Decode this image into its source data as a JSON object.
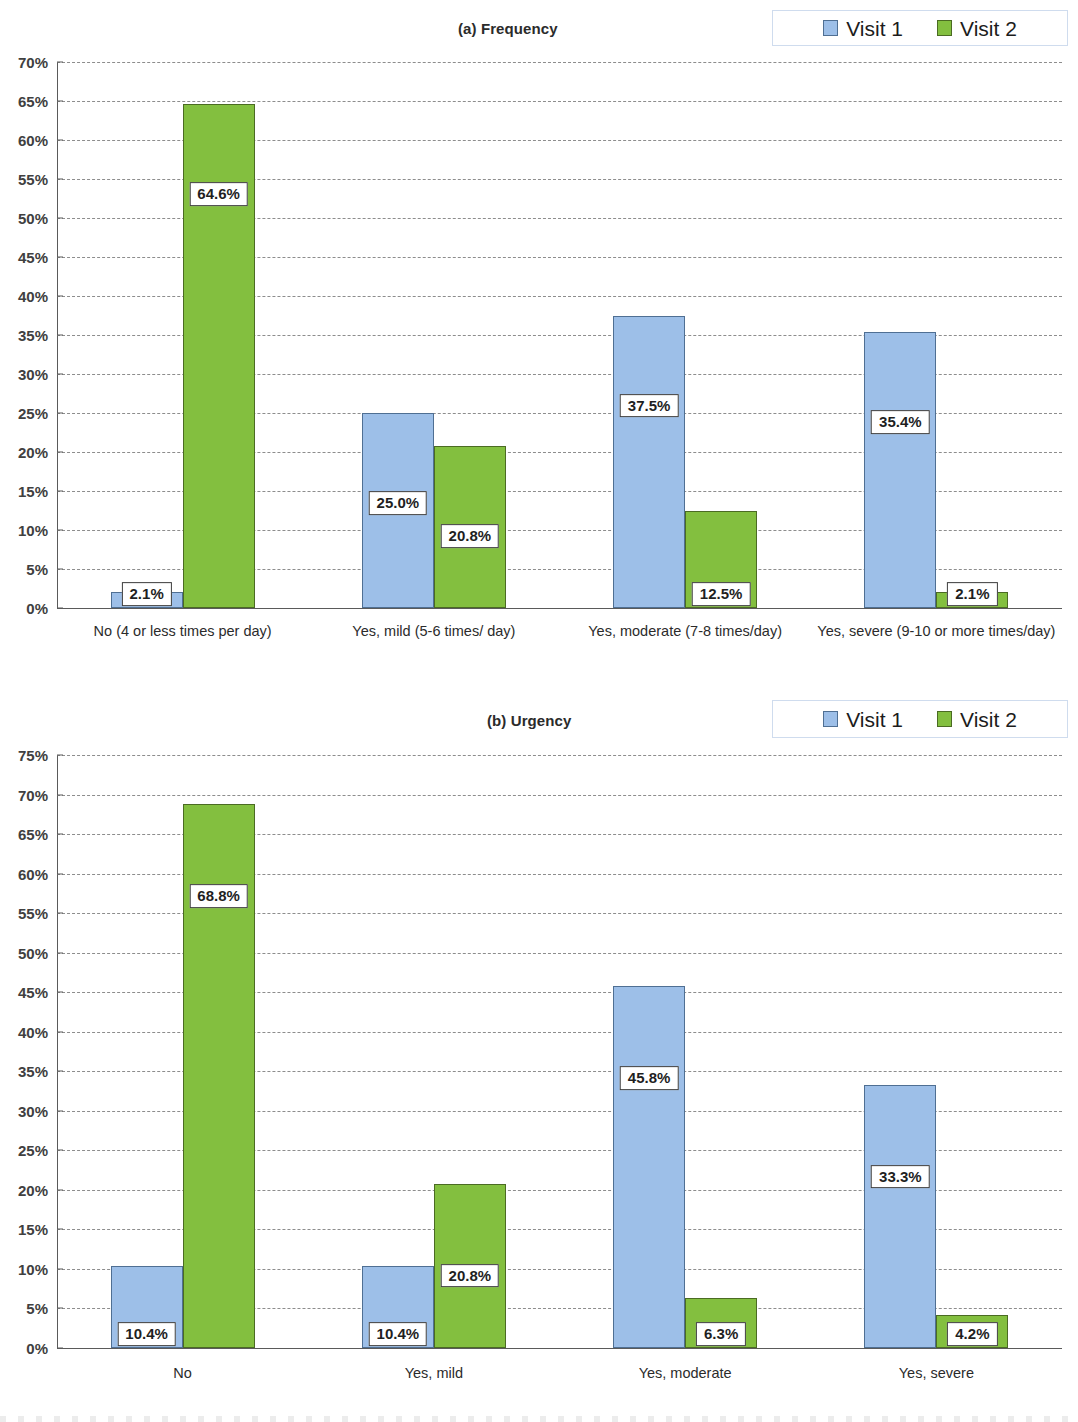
{
  "colors": {
    "visit1": "#9dbfe8",
    "visit1_border": "#4f6f93",
    "visit2": "#83bf3f",
    "visit2_border": "#4b6b23",
    "gridline": "#7a7a7a",
    "axis": "#5a5a5a",
    "text": "#2b2b2b"
  },
  "legend": {
    "visit1_label": "Visit 1",
    "visit2_label": "Visit 2"
  },
  "chart_data": [
    {
      "id": "frequency",
      "type": "bar",
      "title": "(a) Frequency",
      "xlabel": "",
      "ylabel": "",
      "ylim": [
        0,
        70
      ],
      "ytick_step": 5,
      "grid": true,
      "legend_position": "top-right",
      "categories": [
        "No (4 or less times per day)",
        "Yes, mild (5-6 times/ day)",
        "Yes, moderate (7-8 times/day)",
        "Yes, severe (9-10 or more times/day)"
      ],
      "ytick_labels": [
        "0%",
        "5%",
        "10%",
        "15%",
        "20%",
        "25%",
        "30%",
        "35%",
        "40%",
        "45%",
        "50%",
        "55%",
        "60%",
        "65%",
        "70%"
      ],
      "series": [
        {
          "name": "Visit 1",
          "values": [
            2.1,
            25.0,
            37.5,
            35.4
          ],
          "labels": [
            "2.1%",
            "25.0%",
            "37.5%",
            "35.4%"
          ]
        },
        {
          "name": "Visit 2",
          "values": [
            64.6,
            20.8,
            12.5,
            2.1
          ],
          "labels": [
            "64.6%",
            "20.8%",
            "12.5%",
            "2.1%"
          ]
        }
      ]
    },
    {
      "id": "urgency",
      "type": "bar",
      "title": "(b) Urgency",
      "xlabel": "",
      "ylabel": "",
      "ylim": [
        0,
        75
      ],
      "ytick_step": 5,
      "grid": true,
      "legend_position": "top-right",
      "categories": [
        "No",
        "Yes, mild",
        "Yes, moderate",
        "Yes, severe"
      ],
      "ytick_labels": [
        "0%",
        "5%",
        "10%",
        "15%",
        "20%",
        "25%",
        "30%",
        "35%",
        "40%",
        "45%",
        "50%",
        "55%",
        "60%",
        "65%",
        "70%",
        "75%"
      ],
      "series": [
        {
          "name": "Visit 1",
          "values": [
            10.4,
            10.4,
            45.8,
            33.3
          ],
          "labels": [
            "10.4%",
            "10.4%",
            "45.8%",
            "33.3%"
          ]
        },
        {
          "name": "Visit 2",
          "values": [
            68.8,
            20.8,
            6.3,
            4.2
          ],
          "labels": [
            "68.8%",
            "20.8%",
            "6.3%",
            "4.2%"
          ]
        }
      ]
    }
  ]
}
